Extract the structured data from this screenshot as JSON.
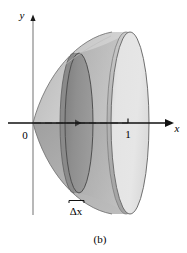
{
  "figure": {
    "caption": "(b)",
    "background_color": "#ffffff"
  },
  "axes": {
    "x_axis": {
      "label": "x",
      "label_style": "italic",
      "origin_px": [
        33,
        123
      ],
      "arrow_tip_px": [
        173,
        123
      ],
      "color": "#000000"
    },
    "y_axis": {
      "label": "y",
      "label_style": "italic",
      "arrow_tip_px": [
        33,
        16
      ],
      "bottom_px": [
        33,
        215
      ],
      "color": "#8c8c8c"
    },
    "ticks": [
      {
        "label": "0",
        "value": 0,
        "position_px": [
          33,
          123
        ]
      },
      {
        "label": "1",
        "value": 1,
        "position_px": [
          127,
          123
        ]
      }
    ]
  },
  "annotations": {
    "delta_x": {
      "symbol": "Δx",
      "bracket_left_px": 70,
      "bracket_right_px": 84,
      "bracket_y_px": 201,
      "label_px": [
        70,
        213
      ]
    }
  },
  "solid": {
    "type": "paraboloid-of-revolution",
    "description": "Solid of revolution generated about the x-axis, vertex at the origin, opening toward positive x, cut by a plane at x = 1.",
    "axis_of_revolution": "x",
    "vertex_px": [
      33,
      123
    ],
    "front_disk": {
      "center_px": [
        130,
        123
      ],
      "semi_axis_x_px": 19,
      "semi_axis_y_px": 91,
      "face_color": "#e2e2e2",
      "edge_color": "#7d7d7d"
    },
    "slice_disk": {
      "center_px": [
        79,
        123
      ],
      "semi_axis_x_px": 14,
      "semi_axis_y_px": 70,
      "face_color": "#909090",
      "edge_color": "#555555"
    },
    "shell": {
      "upper_color": "#cfcfcf",
      "lower_color": "#a8a8a8",
      "outline_color": "#6f6f6f"
    },
    "center_dashed_line": {
      "from_px": [
        33,
        123
      ],
      "to_px": [
        130,
        123
      ],
      "color": "#6e6e6e",
      "dashed": true
    }
  },
  "colors": {
    "ink": "#000000",
    "light_gray": "#e2e2e2",
    "mid_gray": "#a8a8a8",
    "dark_gray": "#909090",
    "outline_gray": "#6f6f6f",
    "axis_gray": "#8c8c8c"
  }
}
